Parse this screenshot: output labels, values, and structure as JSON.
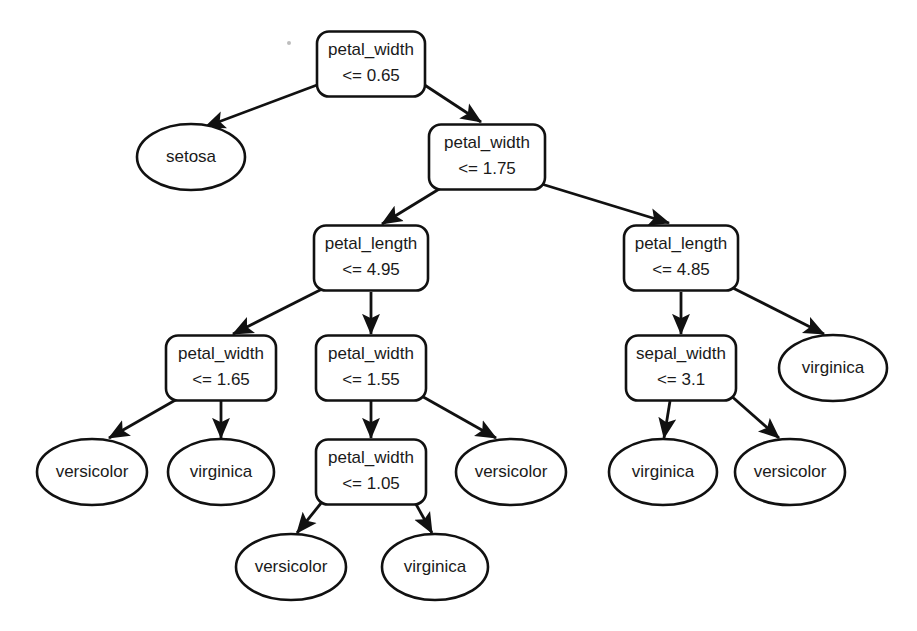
{
  "diagram": {
    "type": "decision-tree",
    "background_color": "#ffffff",
    "stroke_color": "#111111",
    "text_color": "#1a1a1a",
    "decision_node_shape": "rounded-rectangle",
    "leaf_node_shape": "ellipse",
    "edge_style": "straight-arrow"
  },
  "nodes": [
    {
      "id": "n0",
      "kind": "decision",
      "feature": "petal_width",
      "condition": "<= 0.65",
      "x": 371,
      "y": 64,
      "w": 108,
      "h": 65
    },
    {
      "id": "n1",
      "kind": "leaf",
      "label": "setosa",
      "x": 191,
      "y": 157,
      "w": 108,
      "h": 66
    },
    {
      "id": "n2",
      "kind": "decision",
      "feature": "petal_width",
      "condition": "<= 1.75",
      "x": 487,
      "y": 157,
      "w": 116,
      "h": 65
    },
    {
      "id": "n3",
      "kind": "decision",
      "feature": "petal_length",
      "condition": "<= 4.95",
      "x": 371,
      "y": 258,
      "w": 114,
      "h": 65
    },
    {
      "id": "n4",
      "kind": "decision",
      "feature": "petal_length",
      "condition": "<= 4.85",
      "x": 681,
      "y": 258,
      "w": 114,
      "h": 65
    },
    {
      "id": "n5",
      "kind": "decision",
      "feature": "petal_width",
      "condition": "<= 1.65",
      "x": 221,
      "y": 368,
      "w": 110,
      "h": 65
    },
    {
      "id": "n6",
      "kind": "decision",
      "feature": "petal_width",
      "condition": "<= 1.55",
      "x": 371,
      "y": 368,
      "w": 110,
      "h": 65
    },
    {
      "id": "n7",
      "kind": "decision",
      "feature": "sepal_width",
      "condition": "<= 3.1",
      "x": 681,
      "y": 368,
      "w": 110,
      "h": 65
    },
    {
      "id": "n8",
      "kind": "leaf",
      "label": "virginica",
      "x": 833,
      "y": 368,
      "w": 108,
      "h": 66
    },
    {
      "id": "n9",
      "kind": "leaf",
      "label": "versicolor",
      "x": 92,
      "y": 472,
      "w": 110,
      "h": 66
    },
    {
      "id": "n10",
      "kind": "leaf",
      "label": "virginica",
      "x": 221,
      "y": 472,
      "w": 106,
      "h": 66
    },
    {
      "id": "n11",
      "kind": "decision",
      "feature": "petal_width",
      "condition": "<= 1.05",
      "x": 371,
      "y": 472,
      "w": 110,
      "h": 65
    },
    {
      "id": "n12",
      "kind": "leaf",
      "label": "versicolor",
      "x": 511,
      "y": 472,
      "w": 110,
      "h": 66
    },
    {
      "id": "n13",
      "kind": "leaf",
      "label": "virginica",
      "x": 663,
      "y": 472,
      "w": 108,
      "h": 66
    },
    {
      "id": "n14",
      "kind": "leaf",
      "label": "versicolor",
      "x": 790,
      "y": 472,
      "w": 110,
      "h": 66
    },
    {
      "id": "n15",
      "kind": "leaf",
      "label": "versicolor",
      "x": 291,
      "y": 567,
      "w": 110,
      "h": 66
    },
    {
      "id": "n16",
      "kind": "leaf",
      "label": "virginica",
      "x": 435,
      "y": 567,
      "w": 106,
      "h": 66
    }
  ],
  "edges": [
    {
      "from": "n0",
      "to": "n1",
      "x1": 325,
      "y1": 82,
      "x2": 205,
      "y2": 127
    },
    {
      "from": "n0",
      "to": "n2",
      "x1": 420,
      "y1": 82,
      "x2": 481,
      "y2": 122
    },
    {
      "from": "n2",
      "to": "n3",
      "x1": 449,
      "y1": 183,
      "x2": 382,
      "y2": 224
    },
    {
      "from": "n2",
      "to": "n4",
      "x1": 535,
      "y1": 182,
      "x2": 669,
      "y2": 223
    },
    {
      "from": "n3",
      "to": "n5",
      "x1": 330,
      "y1": 285,
      "x2": 233,
      "y2": 334
    },
    {
      "from": "n3",
      "to": "n6",
      "x1": 371,
      "y1": 292,
      "x2": 371,
      "y2": 334
    },
    {
      "from": "n4",
      "to": "n7",
      "x1": 681,
      "y1": 292,
      "x2": 681,
      "y2": 334
    },
    {
      "from": "n4",
      "to": "n8",
      "x1": 727,
      "y1": 285,
      "x2": 824,
      "y2": 334
    },
    {
      "from": "n5",
      "to": "n9",
      "x1": 186,
      "y1": 394,
      "x2": 109,
      "y2": 438
    },
    {
      "from": "n5",
      "to": "n10",
      "x1": 221,
      "y1": 401,
      "x2": 221,
      "y2": 438
    },
    {
      "from": "n6",
      "to": "n11",
      "x1": 371,
      "y1": 401,
      "x2": 371,
      "y2": 438
    },
    {
      "from": "n6",
      "to": "n12",
      "x1": 418,
      "y1": 394,
      "x2": 496,
      "y2": 438
    },
    {
      "from": "n7",
      "to": "n13",
      "x1": 670,
      "y1": 401,
      "x2": 664,
      "y2": 438
    },
    {
      "from": "n7",
      "to": "n14",
      "x1": 729,
      "y1": 394,
      "x2": 779,
      "y2": 438
    },
    {
      "from": "n11",
      "to": "n15",
      "x1": 326,
      "y1": 497,
      "x2": 297,
      "y2": 533
    },
    {
      "from": "n11",
      "to": "n16",
      "x1": 412,
      "y1": 497,
      "x2": 432,
      "y2": 533
    }
  ],
  "speck": {
    "x": 289,
    "y": 43,
    "r": 2
  }
}
